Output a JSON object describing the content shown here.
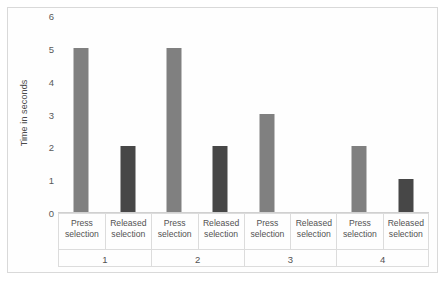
{
  "chart_data": {
    "type": "bar",
    "title": "",
    "xlabel": "",
    "ylabel": "Time in seconds",
    "ylim": [
      0,
      6
    ],
    "yticks": [
      0,
      1,
      2,
      3,
      4,
      5,
      6
    ],
    "grid": false,
    "legend": "none",
    "categories": [
      "1",
      "2",
      "3",
      "4"
    ],
    "series": [
      {
        "name": "Press selection",
        "color": "#808080",
        "values": [
          5,
          5,
          3,
          2
        ]
      },
      {
        "name": "Released selection",
        "color": "#474747",
        "values": [
          2,
          2,
          0,
          1
        ]
      }
    ],
    "group_labels": [
      {
        "group": "1",
        "cells": [
          "Press selection",
          "Released selection"
        ]
      },
      {
        "group": "2",
        "cells": [
          "Press selection",
          "Released selection"
        ]
      },
      {
        "group": "3",
        "cells": [
          "Press selection",
          "Released selection"
        ]
      },
      {
        "group": "4",
        "cells": [
          "Press selection",
          "Released selection"
        ]
      }
    ],
    "label_lines": {
      "press": [
        "Press",
        "selection"
      ],
      "released": [
        "Released",
        "selection"
      ]
    }
  },
  "colors": {
    "press_bar": "#808080",
    "released_bar": "#474747",
    "border": "#d9d9d9",
    "text": "#525252"
  }
}
